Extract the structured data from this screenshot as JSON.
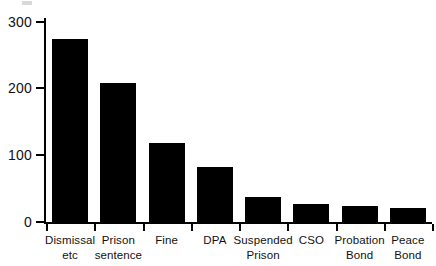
{
  "chart_data": {
    "type": "bar",
    "title": "",
    "subtitle": "",
    "xlabel": "",
    "ylabel": "",
    "ylim": [
      0,
      300
    ],
    "yticks": [
      0,
      100,
      200,
      300
    ],
    "ytick_labels": [
      "0",
      "100",
      "200",
      "300"
    ],
    "grid": false,
    "legend": false,
    "legend_position": "none",
    "bar_color": "#000000",
    "axis_color": "#000000",
    "background_color": "#ffffff",
    "categories": [
      "Dismissal etc",
      "Prison sentence",
      "Fine",
      "DPA",
      "Suspended Prison",
      "CSO",
      "Probation Bond",
      "Peace Bond"
    ],
    "category_lines": [
      [
        "Dismissal",
        "etc"
      ],
      [
        "Prison",
        "sentence"
      ],
      [
        "Fine",
        ""
      ],
      [
        "DPA",
        ""
      ],
      [
        "Suspended",
        "Prison"
      ],
      [
        "CSO",
        ""
      ],
      [
        "Probation",
        "Bond"
      ],
      [
        "Peace",
        "Bond"
      ]
    ],
    "values": [
      274,
      209,
      118,
      83,
      37,
      27,
      24,
      21
    ]
  }
}
